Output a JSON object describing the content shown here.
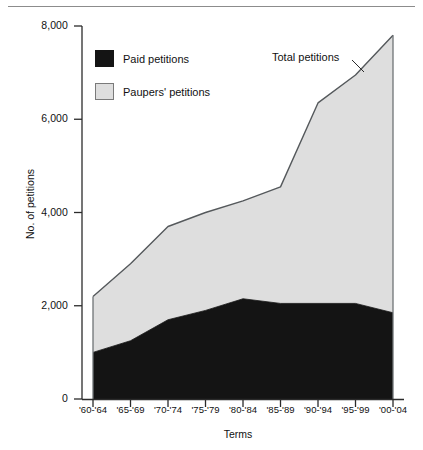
{
  "figure": {
    "background": "#ffffff",
    "rule_color": "#8c8c8c"
  },
  "axes": {
    "y_title": "No. of petitions",
    "x_title": "Terms",
    "y_ticks": [
      "0",
      "2,000",
      "4,000",
      "6,000",
      "8,000"
    ],
    "x_ticks": [
      "'60-'64",
      "'65-'69",
      "'70-'74",
      "'75-'79",
      "'80-'84",
      "'85-'89",
      "'90-'94",
      "'95-'99",
      "'00-'04"
    ]
  },
  "legend": {
    "items": [
      {
        "label": "Paid petitions",
        "color": "#141414",
        "swatch": "paid-swatch"
      },
      {
        "label": "Paupers' petitions",
        "color": "#dedede",
        "swatch": "paupers-swatch"
      }
    ]
  },
  "annotations": [
    {
      "name": "total-petitions-callout",
      "text": "Total petitions"
    }
  ],
  "chart_data": {
    "type": "area",
    "stacked": true,
    "title": "",
    "xlabel": "Terms",
    "ylabel": "No. of petitions",
    "ylim": [
      0,
      8000
    ],
    "ytick_values": [
      0,
      2000,
      4000,
      6000,
      8000
    ],
    "grid": false,
    "legend_position": "upper-left",
    "categories": [
      "'60-'64",
      "'65-'69",
      "'70-'74",
      "'75-'79",
      "'80-'84",
      "'85-'89",
      "'90-'94",
      "'95-'99",
      "'00-'04"
    ],
    "series": [
      {
        "name": "Paid petitions",
        "color": "#141414",
        "values": [
          1000,
          1250,
          1700,
          1900,
          2150,
          2050,
          2050,
          2050,
          1850
        ]
      },
      {
        "name": "Paupers' petitions",
        "color": "#dedede",
        "values": [
          1200,
          1650,
          2000,
          2100,
          2100,
          2500,
          4300,
          4900,
          5950
        ]
      }
    ],
    "total_series": {
      "name": "Total petitions",
      "values": [
        2200,
        2900,
        3700,
        4000,
        4250,
        4550,
        6350,
        6950,
        7800
      ]
    }
  }
}
